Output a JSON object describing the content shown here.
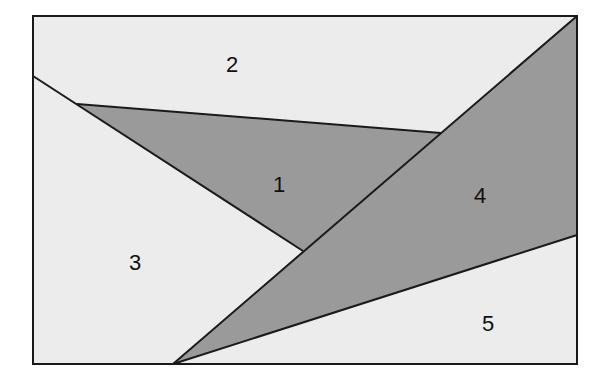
{
  "diagram": {
    "frame": {
      "x": 33,
      "y": 16,
      "width": 544,
      "height": 348
    },
    "colors": {
      "light_fill": "#ececec",
      "dark_fill": "#9a9a9a",
      "stroke": "#1a1a1a"
    },
    "regions": [
      {
        "id": "1",
        "label": "1",
        "shade": "dark",
        "points": "77,104 441,133 303,251",
        "label_x": 279,
        "label_y": 192
      },
      {
        "id": "2",
        "label": "2",
        "shade": "light",
        "points": "33,16 577,16 441,133 77,104 33,76",
        "label_x": 232,
        "label_y": 72
      },
      {
        "id": "3",
        "label": "3",
        "shade": "light",
        "points": "33,76 77,104 303,251 173,364 33,364",
        "label_x": 135,
        "label_y": 270
      },
      {
        "id": "4",
        "label": "4",
        "shade": "dark",
        "points": "577,16 577,235 173,364 303,251 441,133",
        "label_x": 480,
        "label_y": 203
      },
      {
        "id": "5",
        "label": "5",
        "shade": "light",
        "points": "173,364 577,235 577,364",
        "label_x": 488,
        "label_y": 331
      }
    ],
    "lines": [
      {
        "name": "left-diagonal-line",
        "x1": 33,
        "y1": 76,
        "x2": 303,
        "y2": 251
      },
      {
        "name": "triangle-top-line",
        "x1": 77,
        "y1": 104,
        "x2": 441,
        "y2": 133
      },
      {
        "name": "main-diagonal-line",
        "x1": 577,
        "y1": 16,
        "x2": 173,
        "y2": 364
      },
      {
        "name": "lower-line",
        "x1": 173,
        "y1": 364,
        "x2": 577,
        "y2": 235
      }
    ]
  }
}
